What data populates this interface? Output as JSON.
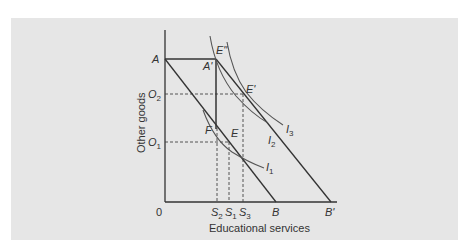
{
  "diagram": {
    "axes": {
      "x_title": "Educational services",
      "y_title": "Other goods",
      "origin": "0"
    },
    "points": {
      "A": {
        "label": "A"
      },
      "A_prime": {
        "label": "A'"
      },
      "E_double_prime": {
        "label": "E\""
      },
      "E_prime": {
        "label": "E'"
      },
      "E": {
        "label": "E"
      },
      "F": {
        "label": "F"
      },
      "B": {
        "label": "B"
      },
      "B_prime": {
        "label": "B'"
      }
    },
    "y_ticks": [
      {
        "base": "O",
        "sub": "2"
      },
      {
        "base": "O",
        "sub": "1"
      }
    ],
    "x_ticks": [
      {
        "base": "S",
        "sub": "2"
      },
      {
        "base": "S",
        "sub": "1"
      },
      {
        "base": "S",
        "sub": "3"
      }
    ],
    "curves": [
      {
        "base": "I",
        "sub": "1"
      },
      {
        "base": "I",
        "sub": "2"
      },
      {
        "base": "I",
        "sub": "3"
      }
    ],
    "colors": {
      "panel": "#e6e6e6",
      "line": "#333333",
      "curve": "#555555"
    }
  }
}
